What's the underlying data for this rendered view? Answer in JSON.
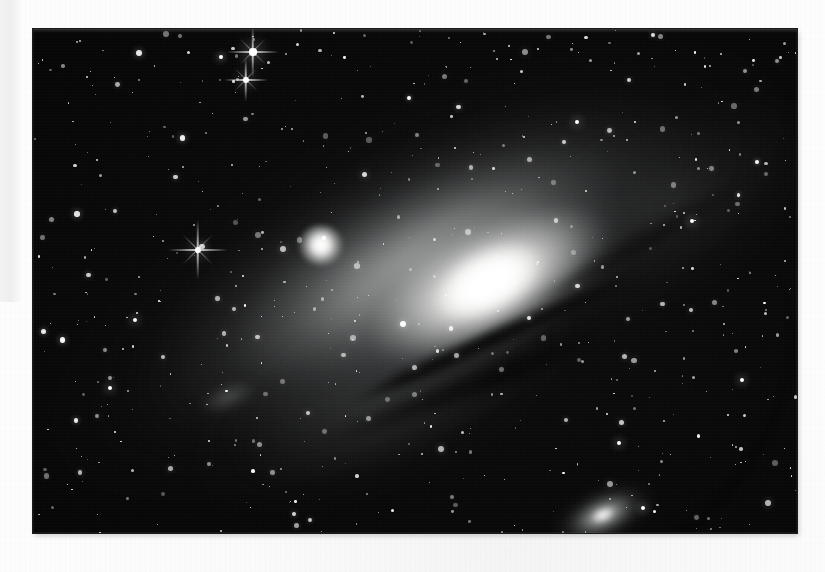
{
  "document": {
    "kind": "scanned-photograph",
    "background_color": "#fdfdfd",
    "caption": ""
  },
  "photo": {
    "alt": "Black and white astronomical photograph of the Andromeda Galaxy",
    "frame": {
      "x": 33,
      "y": 29,
      "width": 764,
      "height": 504
    },
    "background_color": "#050505",
    "highlight_color": "#ffffff",
    "midtone_color": "#9a9c9c",
    "dust_color": "#050506"
  },
  "objects": [
    {
      "id": "m31",
      "label": "M31 Andromeda Galaxy",
      "type": "spiral-galaxy",
      "x": 455,
      "y": 255,
      "angle_deg": -27,
      "brightness": 1.0
    },
    {
      "id": "m32",
      "label": "M32",
      "type": "elliptical-galaxy",
      "x": 288,
      "y": 216,
      "angle_deg": 0,
      "brightness": 0.9
    },
    {
      "id": "m110",
      "label": "M110 / NGC 205",
      "type": "elliptical-galaxy",
      "x": 570,
      "y": 486,
      "angle_deg": -24,
      "brightness": 0.7
    }
  ],
  "bright_stars": [
    {
      "x": 253,
      "y": 52,
      "r": 3.6,
      "spikes": true,
      "spike_len": 26
    },
    {
      "x": 246,
      "y": 80,
      "r": 3.2,
      "spikes": true,
      "spike_len": 22
    },
    {
      "x": 198,
      "y": 250,
      "r": 3.4,
      "spikes": true,
      "spike_len": 30
    },
    {
      "x": 221,
      "y": 57,
      "r": 1.9,
      "spikes": false,
      "spike_len": 0
    },
    {
      "x": 692,
      "y": 221,
      "r": 2.4,
      "spikes": false,
      "spike_len": 0
    },
    {
      "x": 324,
      "y": 238,
      "r": 1.8,
      "spikes": false,
      "spike_len": 0
    },
    {
      "x": 135,
      "y": 320,
      "r": 2.3,
      "spikes": false,
      "spike_len": 0
    },
    {
      "x": 619,
      "y": 443,
      "r": 2.2,
      "spikes": false,
      "spike_len": 0
    },
    {
      "x": 110,
      "y": 388,
      "r": 2.1,
      "spikes": false,
      "spike_len": 0
    },
    {
      "x": 742,
      "y": 380,
      "r": 2.2,
      "spikes": false,
      "spike_len": 0
    },
    {
      "x": 577,
      "y": 122,
      "r": 2.3,
      "spikes": false,
      "spike_len": 0
    },
    {
      "x": 643,
      "y": 508,
      "r": 2.2,
      "spikes": false,
      "spike_len": 0
    }
  ],
  "field": {
    "star_count": 620,
    "seed": 20240711
  },
  "scan_artifacts": {
    "left_band": {
      "x": 0,
      "y": 0,
      "width": 22,
      "height": 302,
      "color": "#efefef"
    },
    "paper_grain": true
  }
}
